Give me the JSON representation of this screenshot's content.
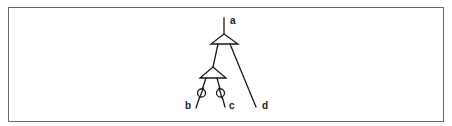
{
  "diagram": {
    "type": "binary-tree-with-operators",
    "labels": {
      "root": "a",
      "leaf_left": "b",
      "leaf_middle": "c",
      "leaf_right": "d"
    },
    "nodes": [
      {
        "id": "top-node",
        "shape": "triangle",
        "children": [
          "lower-node",
          "d"
        ]
      },
      {
        "id": "lower-node",
        "shape": "triangle",
        "children": [
          "b",
          "c"
        ]
      }
    ],
    "markers": [
      {
        "on_edge": "lower-node-b",
        "shape": "circle-with-slash"
      },
      {
        "on_edge": "lower-node-c",
        "shape": "circle-with-slash"
      }
    ],
    "colors": {
      "stroke": "#1a1a1a",
      "frame": "#6a6a6a",
      "background": "#ffffff"
    }
  }
}
